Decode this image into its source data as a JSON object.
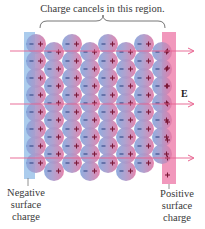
{
  "title": "Charge cancels in this region.",
  "field_label": "E",
  "negative_label": [
    "Negative",
    "surface",
    "charge"
  ],
  "positive_label": [
    "Positive",
    "surface",
    "charge"
  ],
  "colors": {
    "negative_slab": "#9cc3ea",
    "positive_slab": "#ee86b0",
    "sphere_blue": "#8fa9db",
    "sphere_pink": "#e27aa6",
    "field_line": "#e8638f",
    "minus_sign": "#3d4f8c",
    "plus_sign": "#7a1838",
    "brace": "#555555"
  },
  "diagram": {
    "columns": 8,
    "column_x": [
      36,
      54,
      72,
      90,
      108,
      126,
      144,
      162
    ],
    "rows_even": [
      44,
      61,
      78,
      95,
      112,
      129,
      146,
      163
    ],
    "rows_odd": [
      52,
      69,
      86,
      103,
      120,
      137,
      154,
      171
    ],
    "sphere_radius": 10,
    "field_lines_y": [
      51,
      104,
      158
    ],
    "slab_plus_y": [
      51,
      68,
      86,
      104,
      122,
      140,
      158,
      175
    ]
  }
}
